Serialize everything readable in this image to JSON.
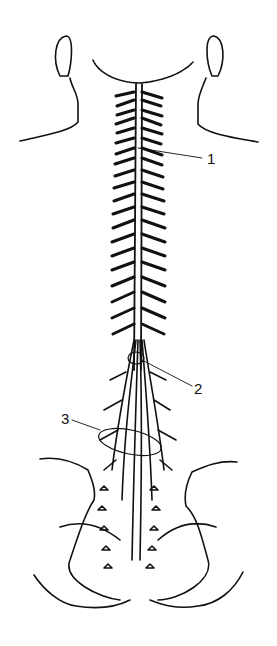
{
  "diagram": {
    "line_color": "#111111",
    "background": "#ffffff",
    "labels": [
      {
        "text": "1",
        "x": 207,
        "y": 148
      },
      {
        "text": "2",
        "x": 194,
        "y": 386
      },
      {
        "text": "3",
        "x": 61,
        "y": 418
      }
    ]
  }
}
